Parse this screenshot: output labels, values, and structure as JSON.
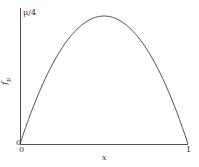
{
  "chart_data": {
    "type": "line",
    "title": "",
    "xlabel": "x",
    "ylabel": "f_μ",
    "xlim": [
      0,
      1
    ],
    "ylim": [
      0,
      "μ/4"
    ],
    "x_ticks": [
      "0",
      "1"
    ],
    "y_ticks": [
      "0",
      "μ/4"
    ],
    "series": [
      {
        "name": "logistic map f(x) = μx(1−x)",
        "x": [
          0,
          0.1,
          0.2,
          0.3,
          0.4,
          0.5,
          0.6,
          0.7,
          0.8,
          0.9,
          1.0
        ],
        "values": [
          0,
          0.36,
          0.64,
          0.84,
          0.96,
          1.0,
          0.96,
          0.84,
          0.64,
          0.36,
          0
        ],
        "values_unit": "fraction of μ/4"
      }
    ],
    "grid": false,
    "legend": null,
    "colors": {
      "curve": "#555555",
      "axes": "#555555"
    }
  },
  "labels": {
    "y_top": "μ/4",
    "y_zero": "0",
    "x_zero": "0",
    "x_one": "1",
    "x_axis": "x",
    "y_axis": "f",
    "y_axis_sub": "μ"
  }
}
